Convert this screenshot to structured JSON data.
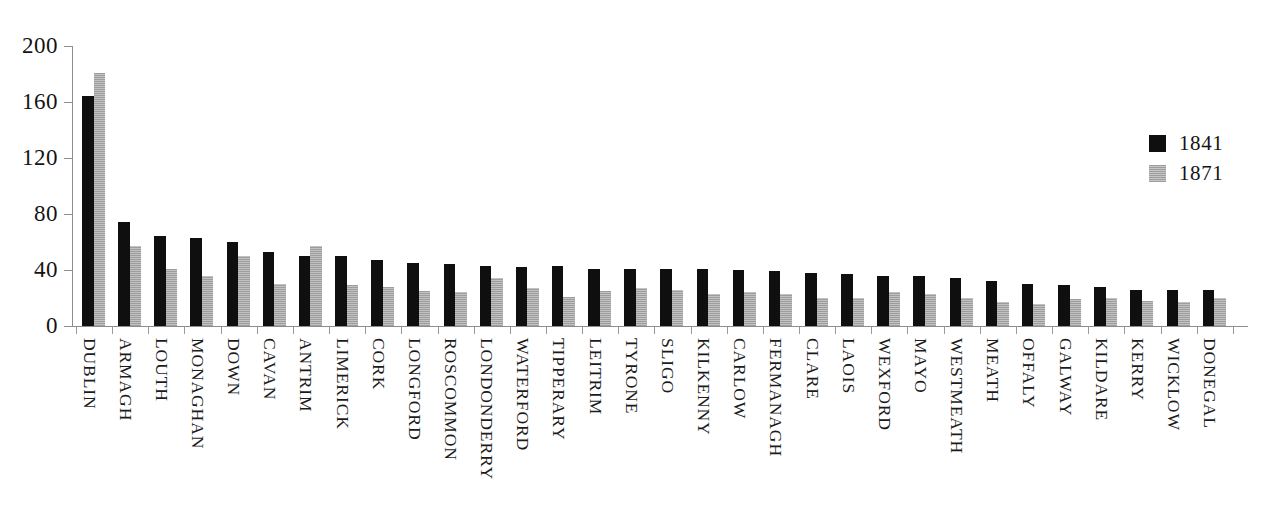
{
  "chart_data": {
    "type": "bar",
    "title": "",
    "subtitle": "",
    "xlabel": "",
    "ylabel": "",
    "ylim": [
      0,
      200
    ],
    "yticks": [
      0,
      40,
      80,
      120,
      160,
      200
    ],
    "ytick_labels": [
      "0",
      "40",
      "80",
      "120",
      "160",
      "200"
    ],
    "grid": false,
    "legend_position": "right",
    "categories": [
      "DUBLIN",
      "ARMAGH",
      "LOUTH",
      "MONAGHAN",
      "DOWN",
      "CAVAN",
      "ANTRIM",
      "LIMERICK",
      "CORK",
      "LONGFORD",
      "ROSCOMMON",
      "LONDONDERRY",
      "WATERFORD",
      "TIPPERARY",
      "LEITRIM",
      "TYRONE",
      "SLIGO",
      "KILKENNY",
      "CARLOW",
      "FERMANAGH",
      "CLARE",
      "LAOIS",
      "WEXFORD",
      "MAYO",
      "WESTMEATH",
      "MEATH",
      "OFFALY",
      "GALWAY",
      "KILDARE",
      "KERRY",
      "WICKLOW",
      "DONEGAL"
    ],
    "series": [
      {
        "name": "1841",
        "color": "#100f0f",
        "values": [
          164,
          74,
          64,
          63,
          60,
          53,
          50,
          50,
          47,
          45,
          44,
          43,
          42,
          43,
          41,
          41,
          41,
          41,
          40,
          39,
          38,
          37,
          36,
          36,
          34,
          32,
          30,
          29,
          28,
          26,
          26,
          26
        ]
      },
      {
        "name": "1871",
        "color": "#b0b0b0",
        "values": [
          181,
          57,
          41,
          36,
          50,
          30,
          57,
          29,
          28,
          25,
          24,
          34,
          27,
          21,
          25,
          27,
          26,
          23,
          24,
          23,
          20,
          20,
          24,
          23,
          20,
          17,
          16,
          19,
          20,
          18,
          17,
          20
        ]
      }
    ]
  },
  "legend": {
    "entries": [
      {
        "label": "1841",
        "swatch": "black-solid-swatch"
      },
      {
        "label": "1871",
        "swatch": "gray-hatched-swatch"
      }
    ]
  }
}
